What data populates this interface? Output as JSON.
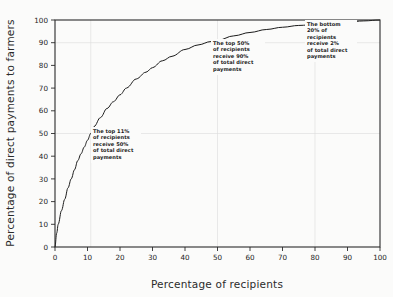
{
  "chart_data": {
    "type": "line",
    "title": "",
    "subtitle": "",
    "xlabel": "Percentage of recipients",
    "ylabel": "Percentage of direct payments to farmers",
    "xlim": [
      0,
      100
    ],
    "ylim": [
      0,
      100
    ],
    "xticks": [
      0,
      10,
      20,
      30,
      40,
      50,
      60,
      70,
      80,
      90,
      100
    ],
    "yticks": [
      0,
      10,
      20,
      30,
      40,
      50,
      60,
      70,
      80,
      90,
      100
    ],
    "xtick_labels": [
      "0",
      "10",
      "20",
      "30",
      "40",
      "50",
      "60",
      "70",
      "80",
      "90",
      "100"
    ],
    "ytick_labels": [
      "0",
      "10",
      "20",
      "30",
      "40",
      "50",
      "60",
      "70",
      "80",
      "90",
      "100"
    ],
    "grid": true,
    "gridlines_x": [
      11,
      50,
      80
    ],
    "gridlines_y": [
      50,
      90
    ],
    "legend": null,
    "legend_position": "none",
    "series": [
      {
        "name": "Cumulative share of direct payments",
        "x": [
          0,
          0.5,
          1,
          2,
          3,
          4,
          5,
          6,
          7,
          8,
          9,
          10,
          11,
          12,
          14,
          16,
          18,
          20,
          22,
          25,
          28,
          30,
          33,
          36,
          40,
          44,
          48,
          50,
          55,
          60,
          65,
          70,
          75,
          80,
          85,
          90,
          95,
          100
        ],
        "y": [
          0,
          6,
          10,
          16,
          21,
          26,
          30,
          34,
          38,
          41,
          44,
          47,
          50,
          53,
          57,
          61,
          64,
          67,
          70,
          74,
          77,
          79,
          82,
          84,
          87,
          89,
          90.5,
          91,
          93,
          94.5,
          95.8,
          96.8,
          97.6,
          98,
          98.6,
          99.1,
          99.6,
          100
        ]
      }
    ],
    "annotations": [
      {
        "id": "top-11-percent",
        "lines": [
          "The top 11%",
          "of recipients",
          "receive 50%",
          "of total direct",
          "payments"
        ],
        "x_ref": 11,
        "y_ref": 50
      },
      {
        "id": "top-50-percent",
        "lines": [
          "The top 50%",
          "of recipients",
          "receive 90%",
          "of total direct",
          "payments"
        ],
        "x_ref": 50,
        "y_ref": 90
      },
      {
        "id": "bottom-20-percent",
        "lines": [
          "The bottom",
          "20% of",
          "recipients",
          "receive 2%",
          "of total direct",
          "payments"
        ],
        "x_ref": 80,
        "y_ref": 98
      }
    ],
    "colors": {
      "curve": "#1a1a1a",
      "frame": "#2a2a2a",
      "grid": "#dcdcdc",
      "background": "#fbfbfa",
      "text": "#1e1e1e"
    }
  }
}
